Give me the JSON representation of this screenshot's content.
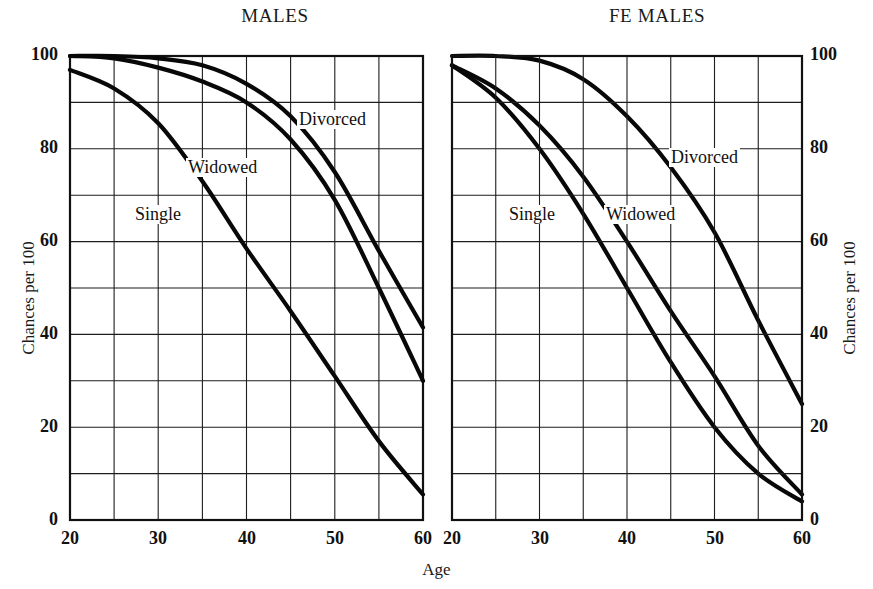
{
  "figure": {
    "xlabel": "Age",
    "ylabel_left": "Chances per 100",
    "ylabel_right": "Chances per 100"
  },
  "panels": [
    {
      "key": "males",
      "title": "MALES"
    },
    {
      "key": "females",
      "title": "FE MALES"
    }
  ],
  "ticks": {
    "y": [
      "100",
      "80",
      "60",
      "40",
      "20",
      "0"
    ],
    "x": [
      "20",
      "30",
      "40",
      "50",
      "60"
    ]
  },
  "labels": {
    "divorced": "Divorced",
    "widowed": "Widowed",
    "single": "Single"
  },
  "colors": {
    "curve": "#080808",
    "grid": "#1d1d1d",
    "frame": "#111111",
    "background": "#ffffff"
  },
  "chart_data": {
    "type": "line",
    "xlabel": "Age",
    "ylabel": "Chances per 100",
    "xlim": [
      20,
      60
    ],
    "ylim": [
      0,
      100
    ],
    "xticks": [
      20,
      30,
      40,
      50,
      60
    ],
    "yticks": [
      0,
      20,
      40,
      60,
      80,
      100
    ],
    "grid": true,
    "grid_x_step": 5,
    "grid_y_step": 10,
    "legend": "inline-curve-labels",
    "x": [
      20,
      25,
      30,
      35,
      40,
      45,
      50,
      55,
      60
    ],
    "panels": [
      {
        "name": "MALES",
        "series": [
          {
            "name": "Divorced",
            "values": [
              100,
              100,
              99.5,
              98,
              94,
              87,
              75,
              58,
              41.5
            ]
          },
          {
            "name": "Widowed",
            "values": [
              100,
              99.5,
              97.5,
              94.5,
              90,
              82,
              69,
              50,
              30
            ]
          },
          {
            "name": "Single",
            "values": [
              97,
              93,
              85.5,
              73,
              58.5,
              45,
              31,
              17,
              5.5
            ]
          }
        ]
      },
      {
        "name": "FEMALES",
        "series": [
          {
            "name": "Divorced",
            "values": [
              100,
              100,
              99,
              95,
              87,
              76,
              62,
              43,
              25
            ]
          },
          {
            "name": "Widowed",
            "values": [
              98,
              93,
              85,
              74,
              60,
              45,
              31,
              16,
              5.5
            ]
          },
          {
            "name": "Single",
            "values": [
              98,
              91,
              80,
              66,
              50,
              34,
              20,
              10,
              4
            ]
          }
        ]
      }
    ]
  }
}
